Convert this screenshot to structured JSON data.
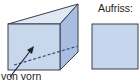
{
  "labels": {
    "front_view_direction": "von vorn",
    "elevation_title": "Aufriss:"
  },
  "colors": {
    "front_face": "#c9d7ec",
    "top_face": "#dfe8f5",
    "side_face": "#a9bde0",
    "elevation_fill": "#c6d6ec",
    "stroke": "#3a3f4a",
    "dashed": "#2d4f86"
  }
}
